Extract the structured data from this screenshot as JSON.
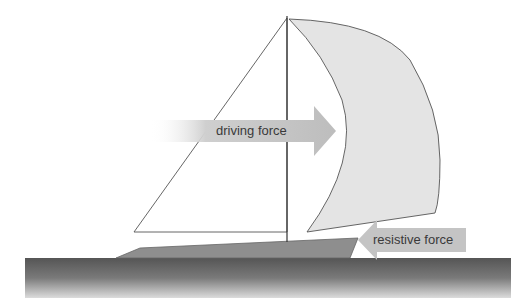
{
  "diagram": {
    "labels": {
      "driving_force": "driving force",
      "resistive_force": "resistive force"
    },
    "colors": {
      "sail_fill": "#e4e4e4",
      "line": "#444444",
      "arrow": "#c0c0c0",
      "hull": "#8a8a8a",
      "water_top": "#555555",
      "water_bottom": "#d8d8d8"
    }
  }
}
